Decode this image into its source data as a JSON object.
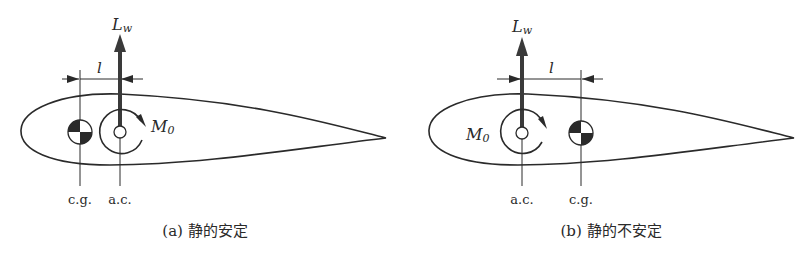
{
  "panels": [
    {
      "id": "a",
      "lift_label": "L",
      "lift_sub": "w",
      "moment_label": "M",
      "moment_sub": "0",
      "distance_label": "l",
      "cg_label": "c.g.",
      "ac_label": "a.c.",
      "caption": "(a)  静的安定"
    },
    {
      "id": "b",
      "lift_label": "L",
      "lift_sub": "w",
      "moment_label": "M",
      "moment_sub": "0",
      "distance_label": "l",
      "cg_label": "c.g.",
      "ac_label": "a.c.",
      "caption": "(b)  静的不安定"
    }
  ],
  "colors": {
    "stroke": "#2a2a2a",
    "arrow": "#3a3a3a",
    "fill": "#ffffff"
  }
}
